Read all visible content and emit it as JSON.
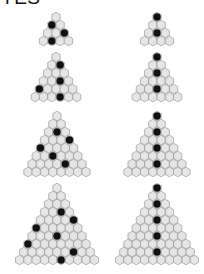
{
  "title": "YES",
  "colors": {
    "cell_fill": "#e6e6e6",
    "cell_stroke": "#8c8c8c",
    "stone": "#111111",
    "background": "#ffffff"
  },
  "geometry": {
    "hex_width": 8.3,
    "row_spacing": 8.0
  },
  "triangles": [
    {
      "name": "left-triangle-1",
      "apex": [
        56,
        17
      ],
      "rows": 4,
      "stones": [
        [
          2,
          1
        ],
        [
          3,
          3
        ],
        [
          4,
          2
        ]
      ]
    },
    {
      "name": "right-triangle-1",
      "apex": [
        157,
        17
      ],
      "rows": 4,
      "stones": [
        [
          1,
          1
        ],
        [
          3,
          2
        ]
      ]
    },
    {
      "name": "left-triangle-2",
      "apex": [
        56,
        57
      ],
      "rows": 6,
      "stones": [
        [
          2,
          2
        ],
        [
          4,
          3
        ],
        [
          5,
          1
        ],
        [
          6,
          4
        ]
      ]
    },
    {
      "name": "right-triangle-2",
      "apex": [
        157,
        57
      ],
      "rows": 6,
      "stones": [
        [
          1,
          1
        ],
        [
          3,
          2
        ],
        [
          5,
          3
        ]
      ]
    },
    {
      "name": "left-triangle-3",
      "apex": [
        57,
        116
      ],
      "rows": 8,
      "stones": [
        [
          3,
          2
        ],
        [
          4,
          4
        ],
        [
          5,
          1
        ],
        [
          6,
          3
        ],
        [
          7,
          5
        ]
      ]
    },
    {
      "name": "right-triangle-3",
      "apex": [
        157,
        116
      ],
      "rows": 8,
      "stones": [
        [
          1,
          1
        ],
        [
          3,
          2
        ],
        [
          5,
          3
        ],
        [
          7,
          4
        ]
      ]
    },
    {
      "name": "left-triangle-4",
      "apex": [
        57,
        188
      ],
      "rows": 10,
      "stones": [
        [
          4,
          3
        ],
        [
          5,
          5
        ],
        [
          6,
          1
        ],
        [
          7,
          4
        ],
        [
          8,
          1
        ],
        [
          9,
          7
        ],
        [
          10,
          6
        ]
      ]
    },
    {
      "name": "right-triangle-4",
      "apex": [
        157,
        188
      ],
      "rows": 10,
      "stones": [
        [
          1,
          1
        ],
        [
          3,
          2
        ],
        [
          5,
          3
        ],
        [
          7,
          4
        ],
        [
          9,
          5
        ]
      ]
    }
  ]
}
